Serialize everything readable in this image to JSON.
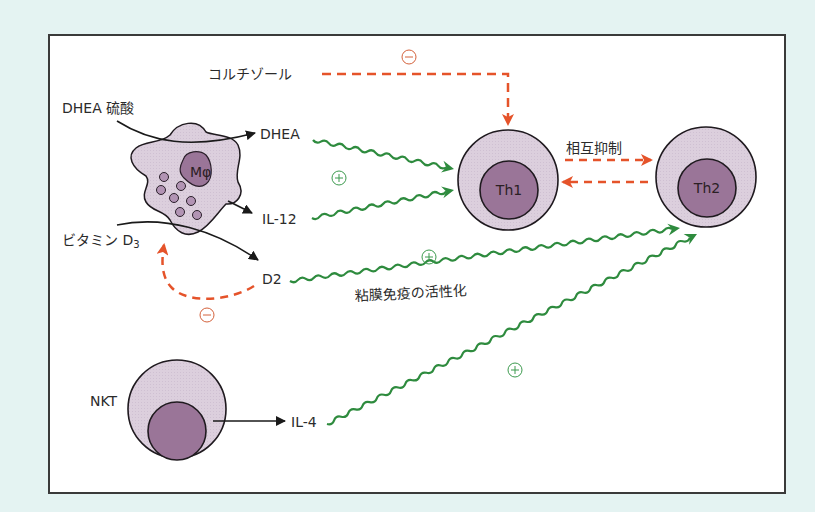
{
  "diagram": {
    "colors": {
      "background": "#e4f3f2",
      "frame": "#ffffff",
      "cell_outer": "#ddd0de",
      "cell_inner": "#9a7598",
      "stimulation": "#2e8b3e",
      "inhibition": "#e5532a",
      "black_arrow": "#1a1a1a"
    },
    "cells": {
      "macrophage": {
        "label": "Mφ"
      },
      "th1": {
        "label": "Th1"
      },
      "th2": {
        "label": "Th2"
      },
      "nkt": {
        "label": "NKT"
      }
    },
    "labels": {
      "cortisol": "コルチゾール",
      "dhea_sulfate": "DHEA 硫酸",
      "dhea": "DHEA",
      "il12": "IL-12",
      "vitamin_d3": "ビタミン D",
      "vitamin_d3_sub": "3",
      "d2": "D2",
      "mucosal_activation": "粘膜免疫の活性化",
      "mutual_inhibition": "相互抑制",
      "il4": "IL-4"
    },
    "signs": {
      "plus": "+",
      "minus": "−"
    },
    "nodes": [
      {
        "id": "cortisol",
        "label": "コルチゾール"
      },
      {
        "id": "dhea_sulfate",
        "label": "DHEA 硫酸"
      },
      {
        "id": "dhea",
        "label": "DHEA"
      },
      {
        "id": "il12",
        "label": "IL-12"
      },
      {
        "id": "vitamin_d3",
        "label": "ビタミン D3"
      },
      {
        "id": "d2",
        "label": "D2"
      },
      {
        "id": "macrophage",
        "label": "Mφ"
      },
      {
        "id": "th1",
        "label": "Th1"
      },
      {
        "id": "th2",
        "label": "Th2"
      },
      {
        "id": "nkt",
        "label": "NKT"
      },
      {
        "id": "il4",
        "label": "IL-4"
      }
    ],
    "edges": [
      {
        "from": "cortisol",
        "to": "th1",
        "type": "inhibition",
        "sign": "−"
      },
      {
        "from": "dhea_sulfate",
        "to": "dhea",
        "type": "conversion",
        "via": "macrophage"
      },
      {
        "from": "macrophage",
        "to": "il12",
        "type": "secretion"
      },
      {
        "from": "vitamin_d3",
        "to": "d2",
        "type": "conversion",
        "via": "macrophage"
      },
      {
        "from": "d2",
        "to": "vitamin_d3",
        "type": "inhibition",
        "sign": "−"
      },
      {
        "from": "dhea",
        "to": "th1",
        "type": "stimulation",
        "sign": "+"
      },
      {
        "from": "il12",
        "to": "th1",
        "type": "stimulation",
        "sign": "+"
      },
      {
        "from": "d2",
        "to": "th2",
        "type": "stimulation",
        "sign": "+",
        "label": "粘膜免疫の活性化"
      },
      {
        "from": "th1",
        "to": "th2",
        "type": "inhibition",
        "label": "相互抑制"
      },
      {
        "from": "th2",
        "to": "th1",
        "type": "inhibition"
      },
      {
        "from": "nkt",
        "to": "il4",
        "type": "secretion"
      },
      {
        "from": "il4",
        "to": "th2",
        "type": "stimulation",
        "sign": "+"
      }
    ]
  }
}
